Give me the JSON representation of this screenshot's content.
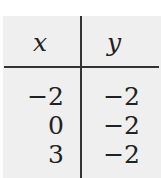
{
  "table": {
    "headers": [
      "x",
      "y"
    ],
    "rows": [
      [
        "−2",
        "−2"
      ],
      [
        "0",
        "−2"
      ],
      [
        "3",
        "−2"
      ]
    ]
  }
}
